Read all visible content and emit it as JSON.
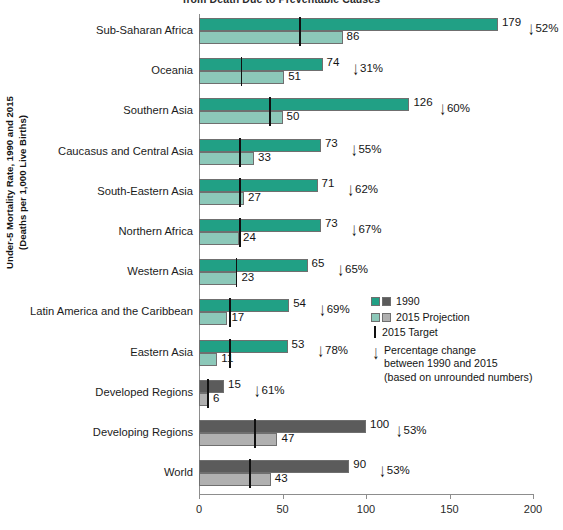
{
  "chart_data": {
    "type": "bar",
    "orientation": "horizontal",
    "title": "from Death Due to Preventable Causes",
    "ylabel": "Under-5 Mortality Rate, 1990 and 2015\n(Deaths per 1,000 Live Births)",
    "ylabel_line1": "Under-5 Mortality Rate, 1990 and 2015",
    "ylabel_line2": "(Deaths per 1,000 Live Births)",
    "xlabel": "",
    "xlim": [
      0,
      200
    ],
    "xticks": [
      0,
      50,
      100,
      150,
      200
    ],
    "xticklabels": [
      "0",
      "50",
      "100",
      "150",
      "200"
    ],
    "grid": false,
    "legend_position": "inside-right",
    "series": [
      {
        "name": "1990",
        "key": "v1990"
      },
      {
        "name": "2015 Projection",
        "key": "v2015"
      },
      {
        "name": "2015 Target",
        "key": "target"
      }
    ],
    "categories": [
      "Sub-Saharan Africa",
      "Oceania",
      "Southern Asia",
      "Caucasus and Central Asia",
      "South-Eastern Asia",
      "Northern Africa",
      "Western Asia",
      "Latin America and the Caribbean",
      "Eastern Asia",
      "Developed Regions",
      "Developing Regions",
      "World"
    ],
    "rows": [
      {
        "category": "Sub-Saharan Africa",
        "v1990": 179,
        "v2015": 86,
        "target": 60,
        "pct_change": "52%",
        "color": "teal"
      },
      {
        "category": "Oceania",
        "v1990": 74,
        "v2015": 51,
        "target": 25,
        "pct_change": "31%",
        "color": "teal"
      },
      {
        "category": "Southern Asia",
        "v1990": 126,
        "v2015": 50,
        "target": 42,
        "pct_change": "60%",
        "color": "teal"
      },
      {
        "category": "Caucasus and Central Asia",
        "v1990": 73,
        "v2015": 33,
        "target": 24,
        "pct_change": "55%",
        "color": "teal"
      },
      {
        "category": "South-Eastern Asia",
        "v1990": 71,
        "v2015": 27,
        "target": 24,
        "pct_change": "62%",
        "color": "teal"
      },
      {
        "category": "Northern Africa",
        "v1990": 73,
        "v2015": 24,
        "target": 24,
        "pct_change": "67%",
        "color": "teal"
      },
      {
        "category": "Western Asia",
        "v1990": 65,
        "v2015": 23,
        "target": 22,
        "pct_change": "65%",
        "color": "teal"
      },
      {
        "category": "Latin America and the Caribbean",
        "v1990": 54,
        "v2015": 17,
        "target": 18,
        "pct_change": "69%",
        "color": "teal"
      },
      {
        "category": "Eastern Asia",
        "v1990": 53,
        "v2015": 11,
        "target": 18,
        "pct_change": "78%",
        "color": "teal"
      },
      {
        "category": "Developed Regions",
        "v1990": 15,
        "v2015": 6,
        "target": 5,
        "pct_change": "61%",
        "color": "gray"
      },
      {
        "category": "Developing Regions",
        "v1990": 100,
        "v2015": 47,
        "target": 33,
        "pct_change": "53%",
        "color": "gray"
      },
      {
        "category": "World",
        "v1990": 90,
        "v2015": 43,
        "target": 30,
        "pct_change": "53%",
        "color": "gray"
      }
    ],
    "colors": {
      "teal_dark": "#21a085",
      "teal_light": "#8cc8b9",
      "gray_dark": "#5b5b5b",
      "gray_light": "#b0b0b0",
      "target_line": "#101010",
      "axis": "#8d8d8d"
    }
  },
  "legend": {
    "items": [
      {
        "label": "1990"
      },
      {
        "label": "2015 Projection"
      }
    ],
    "target_label": "2015 Target",
    "pct_line1": "Percentage change",
    "pct_line2": "between 1990 and 2015",
    "pct_line3": "(based on unrounded numbers)"
  }
}
